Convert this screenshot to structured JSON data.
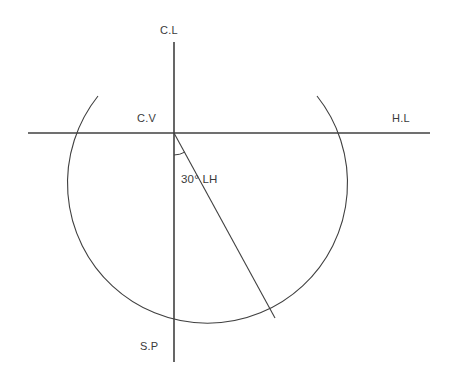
{
  "diagram": {
    "background_color": "#ffffff",
    "line_color": "#404040",
    "text_color": "#3a3a3a",
    "labels": {
      "center_line": "C.L",
      "center_of_vision": "C.V",
      "horizon_line": "H.L",
      "station_point": "S.P",
      "angle": "30° LH"
    },
    "geometry": {
      "vertical_line": {
        "x": 174,
        "y_top": 42,
        "y_bottom": 362
      },
      "horizontal_line": {
        "y": 133,
        "x_left": 28,
        "x_right": 430
      },
      "center_of_vision_point": {
        "x": 174,
        "y": 133
      },
      "circle": {
        "cx": 202,
        "cy": 195,
        "r": 140
      },
      "angle_degrees": 30,
      "angle_direction": "LH",
      "angle_arc_radius": 22,
      "diagonal_line": {
        "x1": 174,
        "y1": 133,
        "x2": 275,
        "y2": 318
      }
    }
  }
}
